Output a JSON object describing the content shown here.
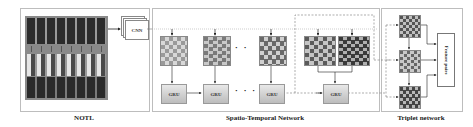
{
  "panels": {
    "notl": {
      "label": "NOTL"
    },
    "spatio_temporal": {
      "label": "Spatio-Temporal Network"
    },
    "triplet": {
      "label": "Triplet network"
    }
  },
  "cnn": {
    "label": "CNN"
  },
  "gru": {
    "label": "GRU",
    "count": 4
  },
  "feature_pairs": {
    "label": "Feature pairs"
  },
  "colors": {
    "panel_border": "#bdbdbd",
    "dark_cell": "#3a3a3a",
    "mid_cell": "#8a8a8a",
    "light_cell": "#d8d8d8",
    "dashed_line": "#777777"
  }
}
